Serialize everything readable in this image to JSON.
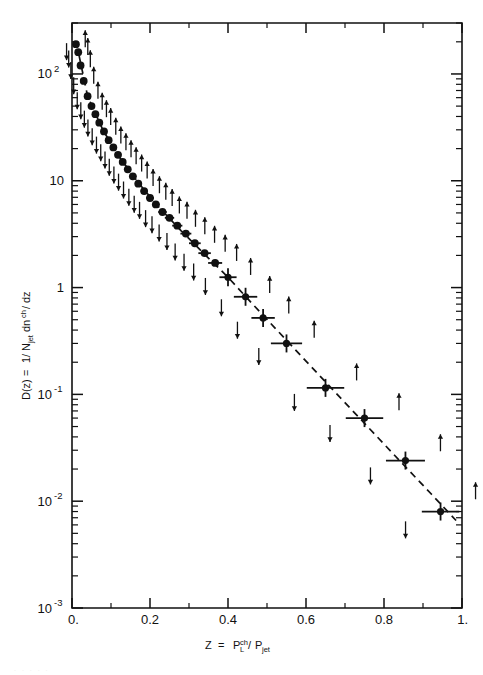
{
  "figure": {
    "background_color": "#ffffff",
    "ink_color": "#111111",
    "width": 483,
    "height": 675
  },
  "axes": {
    "x": {
      "label_parts": {
        "variable": "Z",
        "equals": "=",
        "numerator": "P",
        "numerator_sub": "L",
        "numerator_sup": "ch",
        "slash": "/",
        "denominator": "P",
        "denominator_sub": "jet"
      },
      "label_plain": "Z = P_L^ch / P_jet",
      "tick_labels": [
        "0.",
        "0.2",
        "0.4",
        "0.6",
        "0.8",
        "1."
      ],
      "tick_values": [
        0,
        0.2,
        0.4,
        0.6,
        0.8,
        1.0
      ],
      "minor_tick_values": [
        0.1,
        0.3,
        0.5,
        0.7,
        0.9
      ],
      "range": [
        0,
        1.0
      ],
      "scale": "linear"
    },
    "y": {
      "label_parts": {
        "function": "D(z)",
        "equals": "=",
        "prefactor_num": "1",
        "prefactor_slash": "/",
        "prefactor_den": "N",
        "prefactor_den_sub": "jet",
        "term": "dn",
        "term_sup": "ch",
        "term_slash": "/",
        "term_den": "dz"
      },
      "label_plain": "D(z) = 1/N_jet dn^ch/dz",
      "tick_labels": [
        "10 2",
        "10",
        "1",
        "10 -1",
        "10 -2",
        "10 -3"
      ],
      "tick_mantissas": [
        "10",
        "10",
        "1",
        "10",
        "10",
        "10"
      ],
      "tick_exponents": [
        "2",
        "",
        "",
        "-1",
        "-2",
        "-3"
      ],
      "tick_values": [
        100,
        10,
        1,
        0.1,
        0.01,
        0.001
      ],
      "range": [
        0.001,
        300
      ],
      "scale": "log"
    },
    "frame": {
      "left": 72,
      "right": 462,
      "top": 23,
      "bottom": 608
    },
    "grid": false
  },
  "chart_data": {
    "type": "scatter",
    "title": "",
    "subtitle": "",
    "xlabel": "Z = P_L^ch / P_jet",
    "ylabel": "D(z) = 1/N_jet dn^ch/dz",
    "xlim": [
      0,
      1.0
    ],
    "ylim": [
      0.001,
      300
    ],
    "yscale": "log",
    "xscale": "linear",
    "grid": false,
    "legend": null,
    "series": [
      {
        "name": "fragmentation function D(z)",
        "marker": "filled-circle",
        "points": [
          {
            "x": 0.01,
            "y": 190.0,
            "xerr": 0.006,
            "up": 230.0,
            "down": 150.0
          },
          {
            "x": 0.016,
            "y": 160.0,
            "xerr": 0.006,
            "up": 195.0,
            "down": 128.0
          },
          {
            "x": 0.022,
            "y": 120.0,
            "xerr": 0.006,
            "up": 150.0,
            "down": 100.0
          },
          {
            "x": 0.03,
            "y": 86.0,
            "xerr": 0.006,
            "up": 105.0,
            "down": 72.0
          },
          {
            "x": 0.04,
            "y": 62.0,
            "xerr": 0.007,
            "up": 76.0,
            "down": 52.0
          },
          {
            "x": 0.05,
            "y": 50.0,
            "xerr": 0.007,
            "up": 60.0,
            "down": 42.0
          },
          {
            "x": 0.06,
            "y": 42.0,
            "xerr": 0.007,
            "up": 51.0,
            "down": 35.0
          },
          {
            "x": 0.07,
            "y": 35.0,
            "xerr": 0.007,
            "up": 43.0,
            "down": 29.0
          },
          {
            "x": 0.082,
            "y": 29.0,
            "xerr": 0.008,
            "up": 35.0,
            "down": 24.0
          },
          {
            "x": 0.094,
            "y": 24.0,
            "xerr": 0.008,
            "up": 29.0,
            "down": 20.0
          },
          {
            "x": 0.106,
            "y": 20.5,
            "xerr": 0.008,
            "up": 25.0,
            "down": 17.0
          },
          {
            "x": 0.118,
            "y": 17.5,
            "xerr": 0.008,
            "up": 21.5,
            "down": 14.5
          },
          {
            "x": 0.13,
            "y": 15.0,
            "xerr": 0.008,
            "up": 18.5,
            "down": 12.4
          },
          {
            "x": 0.143,
            "y": 12.8,
            "xerr": 0.008,
            "up": 15.8,
            "down": 10.5
          },
          {
            "x": 0.156,
            "y": 11.0,
            "xerr": 0.009,
            "up": 13.6,
            "down": 9.0
          },
          {
            "x": 0.17,
            "y": 9.4,
            "xerr": 0.009,
            "up": 11.6,
            "down": 7.6
          },
          {
            "x": 0.185,
            "y": 8.0,
            "xerr": 0.009,
            "up": 9.9,
            "down": 6.5
          },
          {
            "x": 0.2,
            "y": 6.9,
            "xerr": 0.01,
            "up": 8.6,
            "down": 5.6
          },
          {
            "x": 0.215,
            "y": 6.0,
            "xerr": 0.01,
            "up": 7.5,
            "down": 4.9
          },
          {
            "x": 0.232,
            "y": 5.1,
            "xerr": 0.011,
            "up": 6.4,
            "down": 4.1
          },
          {
            "x": 0.25,
            "y": 4.5,
            "xerr": 0.012,
            "up": 5.7,
            "down": 3.6
          },
          {
            "x": 0.27,
            "y": 3.8,
            "xerr": 0.013,
            "up": 4.8,
            "down": 3.0
          },
          {
            "x": 0.292,
            "y": 3.2,
            "xerr": 0.014,
            "up": 4.1,
            "down": 2.5
          },
          {
            "x": 0.315,
            "y": 2.6,
            "xerr": 0.015,
            "up": 3.4,
            "down": 2.0
          },
          {
            "x": 0.34,
            "y": 2.1,
            "xerr": 0.016,
            "up": 2.8,
            "down": 1.6
          },
          {
            "x": 0.367,
            "y": 1.7,
            "xerr": 0.018,
            "up": 2.3,
            "down": 1.3
          },
          {
            "x": 0.4,
            "y": 1.25,
            "xerr": 0.022,
            "up": 1.7,
            "down": 0.95
          },
          {
            "x": 0.445,
            "y": 0.82,
            "xerr": 0.03,
            "up": 1.15,
            "down": 0.6
          },
          {
            "x": 0.49,
            "y": 0.52,
            "xerr": 0.03,
            "up": 0.74,
            "down": 0.37
          },
          {
            "x": 0.55,
            "y": 0.3,
            "xerr": 0.04,
            "up": 0.44,
            "down": 0.21
          },
          {
            "x": 0.65,
            "y": 0.115,
            "xerr": 0.048,
            "up": 0.175,
            "down": 0.078
          },
          {
            "x": 0.75,
            "y": 0.06,
            "xerr": 0.048,
            "up": 0.092,
            "down": 0.04
          },
          {
            "x": 0.855,
            "y": 0.024,
            "xerr": 0.05,
            "up": 0.038,
            "down": 0.016
          },
          {
            "x": 0.945,
            "y": 0.008,
            "xerr": 0.048,
            "up": 0.0135,
            "down": 0.005
          }
        ]
      }
    ],
    "fit": {
      "name": "dashed fit curve",
      "style": "dashed",
      "points": [
        {
          "x": 0.018,
          "y": 150.0
        },
        {
          "x": 0.04,
          "y": 62.0
        },
        {
          "x": 0.08,
          "y": 29.5
        },
        {
          "x": 0.12,
          "y": 17.0
        },
        {
          "x": 0.17,
          "y": 9.6
        },
        {
          "x": 0.22,
          "y": 5.8
        },
        {
          "x": 0.28,
          "y": 3.4
        },
        {
          "x": 0.34,
          "y": 2.05
        },
        {
          "x": 0.4,
          "y": 1.25
        },
        {
          "x": 0.46,
          "y": 0.72
        },
        {
          "x": 0.52,
          "y": 0.42
        },
        {
          "x": 0.6,
          "y": 0.205
        },
        {
          "x": 0.68,
          "y": 0.1
        },
        {
          "x": 0.76,
          "y": 0.049
        },
        {
          "x": 0.84,
          "y": 0.024
        },
        {
          "x": 0.92,
          "y": 0.0118
        },
        {
          "x": 0.985,
          "y": 0.0066
        }
      ]
    },
    "annotations": {
      "description": "Small vertical up/down arrows flanking each data point indicate systematic uncertainty bounds.",
      "arrow_up_symbol": "↑",
      "arrow_down_symbol": "↓"
    }
  }
}
